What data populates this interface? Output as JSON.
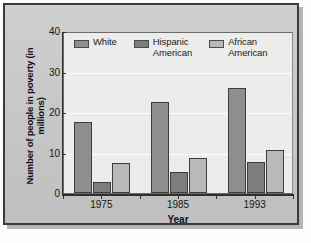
{
  "chart_data": {
    "type": "bar",
    "title": "",
    "xlabel": "Year",
    "ylabel": "Number of people in poverty (in millions)",
    "categories": [
      "1975",
      "1985",
      "1993"
    ],
    "series": [
      {
        "name": "White",
        "values": [
          17.5,
          22.5,
          26.0
        ],
        "color": "#8e8e8e"
      },
      {
        "name": "Hispanic\nAmerican",
        "values": [
          2.8,
          5.2,
          7.7
        ],
        "color": "#7d7d7d"
      },
      {
        "name": "African\nAmerican",
        "values": [
          7.5,
          8.6,
          10.5
        ],
        "color": "#b9b9b9"
      }
    ],
    "ylim": [
      0,
      40
    ],
    "yticks": [
      "0",
      "10",
      "20",
      "30",
      "40"
    ],
    "ytick_values": [
      0,
      10,
      20,
      30,
      40
    ],
    "grid": true,
    "grid_axis": "y",
    "legend_position": "top-inside"
  },
  "axis": {
    "y_title": "Number of people in poverty (in millions)",
    "x_title": "Year"
  },
  "legend": {
    "items": [
      {
        "label": "White"
      },
      {
        "label": "Hispanic\nAmerican"
      },
      {
        "label": "African\nAmerican"
      }
    ]
  }
}
